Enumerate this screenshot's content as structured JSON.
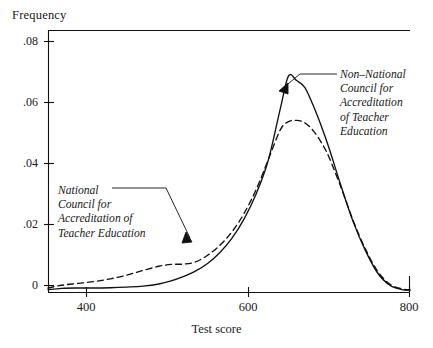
{
  "chart_data": {
    "type": "line",
    "title": "",
    "subtitle": "",
    "xlabel": "Test score",
    "ylabel": "Frequency",
    "xlim": [
      353,
      800
    ],
    "ylim": [
      0,
      0.0855
    ],
    "grid": false,
    "legend_position": "inline-annotations",
    "xticks": [
      400,
      600,
      800
    ],
    "xtick_labels": [
      "400",
      "600",
      "800"
    ],
    "yticks": [
      0,
      0.02,
      0.04,
      0.06,
      0.08
    ],
    "ytick_labels": [
      "0",
      ".02",
      ".04",
      ".06",
      ".08"
    ],
    "x": [
      353,
      370,
      390,
      410,
      430,
      450,
      470,
      490,
      505,
      520,
      535,
      550,
      565,
      580,
      595,
      610,
      625,
      640,
      650,
      660,
      670,
      680,
      690,
      700,
      715,
      730,
      745,
      760,
      775,
      790,
      800
    ],
    "series": [
      {
        "name": "Non-National Council for Accreditation of Teacher Education",
        "style": "solid",
        "color": "#111111",
        "values": [
          0.0008,
          0.0012,
          0.0013,
          0.0013,
          0.0014,
          0.0016,
          0.0019,
          0.0026,
          0.0036,
          0.005,
          0.0068,
          0.0093,
          0.0128,
          0.0175,
          0.0238,
          0.032,
          0.043,
          0.06,
          0.0705,
          0.069,
          0.0668,
          0.0612,
          0.0545,
          0.047,
          0.0345,
          0.0228,
          0.0135,
          0.0062,
          0.0022,
          0.0008,
          0.0006
        ]
      },
      {
        "name": "National Council for Accreditation of Teacher Education",
        "style": "dashed",
        "color": "#111111",
        "values": [
          0.0013,
          0.0022,
          0.0028,
          0.0034,
          0.0043,
          0.0055,
          0.007,
          0.0084,
          0.009,
          0.0091,
          0.0098,
          0.012,
          0.0152,
          0.0196,
          0.0256,
          0.0334,
          0.0432,
          0.053,
          0.0556,
          0.056,
          0.0552,
          0.0528,
          0.049,
          0.044,
          0.034,
          0.0232,
          0.014,
          0.0068,
          0.0026,
          0.001,
          0.0007
        ]
      }
    ],
    "annotations": [
      {
        "id": "ncate",
        "lines": [
          "National",
          "Council for",
          "Accreditation of",
          "Teacher Education"
        ],
        "target_series": "National Council for Accreditation of Teacher Education",
        "target_x": 530,
        "target_y": 0.0135
      },
      {
        "id": "non-ncate",
        "lines": [
          "Non–National",
          "Council for",
          "Accreditation",
          "of Teacher",
          "Education"
        ],
        "target_series": "Non-National Council for Accreditation of Teacher Education",
        "target_x": 663,
        "target_y": 0.0655
      }
    ]
  },
  "axis": {
    "frame_color": "#111111"
  }
}
